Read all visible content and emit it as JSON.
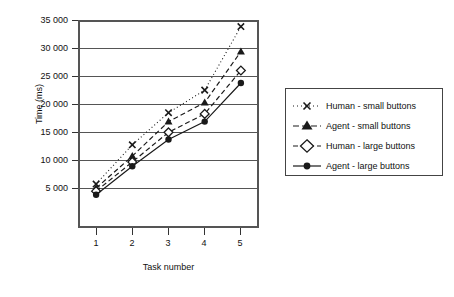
{
  "chart_data": {
    "type": "line",
    "title": "",
    "xlabel": "Task number",
    "ylabel": "Time (ms)",
    "categories": [
      "1",
      "2",
      "3",
      "4",
      "5"
    ],
    "x": [
      1,
      2,
      3,
      4,
      5
    ],
    "xlim": [
      0.5,
      5.5
    ],
    "ylim": [
      0,
      35000
    ],
    "yticks": [
      5000,
      10000,
      15000,
      20000,
      25000,
      30000,
      35000
    ],
    "ytick_labels": [
      "5 000",
      "10 000",
      "15 000",
      "20 000",
      "25 000",
      "30 000",
      "35 000"
    ],
    "grid": "horizontal",
    "legend_position": "right",
    "series": [
      {
        "name": "Human - small buttons",
        "values": [
          7400,
          14000,
          19400,
          23200,
          33900
        ],
        "marker": "x-cross",
        "line_style": "dotted",
        "color": "#1a1a1a"
      },
      {
        "name": "Agent - small buttons",
        "values": [
          6700,
          12100,
          17900,
          21100,
          29700
        ],
        "marker": "filled-triangle",
        "line_style": "dashed",
        "color": "#1a1a1a"
      },
      {
        "name": "Human - large buttons",
        "values": [
          6200,
          11100,
          16100,
          19200,
          26500
        ],
        "marker": "open-diamond",
        "line_style": "dashed",
        "color": "#1a1a1a"
      },
      {
        "name": "Agent - large buttons",
        "values": [
          5600,
          10400,
          14900,
          17900,
          24400
        ],
        "marker": "filled-circle",
        "line_style": "solid",
        "color": "#1a1a1a"
      }
    ]
  },
  "axes": {
    "y_title": "Time (ms)",
    "x_title": "Task number",
    "y_labels": [
      "35 000",
      "30 000",
      "25 000",
      "20 000",
      "15 000",
      "10 000",
      "5 000"
    ],
    "x_labels": [
      "1",
      "2",
      "3",
      "4",
      "5"
    ]
  },
  "legend": {
    "items": [
      {
        "label": "Human - small buttons"
      },
      {
        "label": "Agent - small buttons"
      },
      {
        "label": "Human - large buttons"
      },
      {
        "label": "Agent - large buttons"
      }
    ]
  },
  "colors": {
    "ink": "#1a1a1a",
    "axis": "#555555",
    "background": "#ffffff"
  }
}
